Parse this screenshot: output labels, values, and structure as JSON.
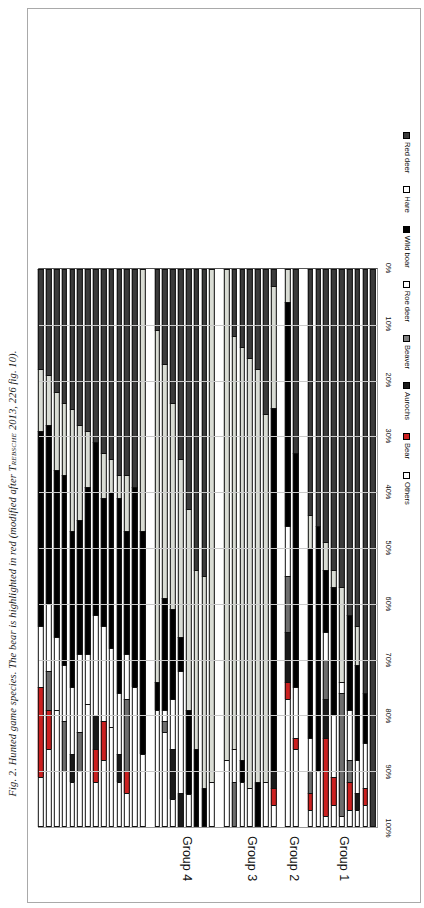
{
  "caption": {
    "prefix": "Fig. 2. Hunted game species. The bear is highlighted in red (modified after ",
    "author": "Trebsche",
    "suffix": " 2013, 226 fig. 10)."
  },
  "chart_data": {
    "type": "bar",
    "orientation": "horizontal",
    "stacked": true,
    "title": "Hunted game species",
    "xlabel": "",
    "ylabel": "",
    "xlim": [
      0,
      100
    ],
    "grid": true,
    "legend_position": "top",
    "axis_ticks": [
      "0%",
      "10%",
      "20%",
      "30%",
      "40%",
      "50%",
      "60%",
      "70%",
      "80%",
      "90%",
      "100%"
    ],
    "legend": [
      {
        "name": "Red deer",
        "color": "#3b3b3b",
        "border": "#000000"
      },
      {
        "name": "Hare",
        "color": "#ffffff",
        "border": "#000000"
      },
      {
        "name": "Wild boar",
        "color": "#000000",
        "border": "#000000"
      },
      {
        "name": "Roe deer",
        "color": "#ffffff",
        "border": "#000000"
      },
      {
        "name": "Beaver",
        "color": "#808080",
        "border": "#000000"
      },
      {
        "name": "Aurochs",
        "color": "#1a1a1a",
        "border": "#000000"
      },
      {
        "name": "Bear",
        "color": "#cc2020",
        "border": "#000000"
      },
      {
        "name": "Others",
        "color": "#ffffff",
        "border": "#000000"
      }
    ],
    "series_order": [
      "Red deer",
      "Roe deer",
      "Wild boar",
      "Hare",
      "Beaver",
      "Aurochs",
      "Bear",
      "Others"
    ],
    "series_colors": {
      "Red deer": "#3b3b3b",
      "Roe deer": "#d9dcd4",
      "Wild boar": "#000000",
      "Hare": "#ffffff",
      "Beaver": "#6e6e6e",
      "Aurochs": "#1a1a1a",
      "Bear": "#cc2020",
      "Others": "#ffffff"
    },
    "groups": [
      {
        "label": "Group 1",
        "count": 9
      },
      {
        "label": "Group 2",
        "count": 2
      },
      {
        "label": "Group 3",
        "count": 7
      },
      {
        "label": "Group 4",
        "count": 8
      },
      {
        "label": "Group 5",
        "count": 16
      }
    ],
    "categories": [
      "Tartscher Bichl",
      "Perchtoldsdorf-Bachacker",
      "Inzersdorf-Walpersdorf Nord",
      "Frauenberg bei Weitenburg",
      "Châtillon-sur-Glâne",
      "Burgstallkogel",
      "Eiersberg",
      "Most na Soči",
      "Heuneburg VIb-I",
      "Arnsleiden",
      "Breisach-Münsterberg",
      "Geispolsheim",
      "Wolfgantzen",
      "Tešetice",
      "Göllersreuther Platte",
      "Jenštejn",
      "Bretten-Bauerbach",
      "Unterparschenbrunn",
      "Poštelovice",
      "Radovesice (I-III)",
      "Göttlesbrunn",
      "Stuttgart-Mühlhausen",
      "Hochdorf",
      "Heilbronn-Neckargartach",
      "Tuchoměřice",
      "Heidengraben",
      "Niedererlbach",
      "Vadena/Pfatten I-III",
      "Oberschauersberg",
      "Kamegg",
      "Nördlingen-Baldingen",
      "Dürrnberg-Ramsautal",
      "Stična I-III",
      "Stufels-Dominik I-VIII",
      "Staffelberg",
      "Rottenburg-Siebenlinden",
      "Praha-Podboří",
      "Michelstetten",
      "Ehrenbürg",
      "Bad Friedrichshall-Maßleiten"
    ],
    "rows": [
      {
        "category": "Tartscher Bichl",
        "values": {
          "Red deer": 100,
          "Roe deer": 0,
          "Wild boar": 0,
          "Hare": 0,
          "Beaver": 0,
          "Aurochs": 0,
          "Bear": 0,
          "Others": 0
        }
      },
      {
        "category": "Perchtoldsdorf-Bachacker",
        "values": {
          "Red deer": 76,
          "Roe deer": 0,
          "Wild boar": 9,
          "Hare": 8,
          "Beaver": 0,
          "Aurochs": 0,
          "Bear": 3,
          "Others": 4
        }
      },
      {
        "category": "Inzersdorf-Walpersdorf Nord",
        "values": {
          "Red deer": 64,
          "Roe deer": 7,
          "Wild boar": 17,
          "Hare": 6,
          "Beaver": 0,
          "Aurochs": 3,
          "Bear": 0,
          "Others": 3
        }
      },
      {
        "category": "Frauenberg bei Weitenburg",
        "values": {
          "Red deer": 62,
          "Roe deer": 0,
          "Wild boar": 17,
          "Hare": 9,
          "Beaver": 4,
          "Aurochs": 0,
          "Bear": 5,
          "Others": 3
        }
      },
      {
        "category": "Châtillon-sur-Glâne",
        "values": {
          "Red deer": 57,
          "Roe deer": 17,
          "Wild boar": 0,
          "Hare": 2,
          "Beaver": 22,
          "Aurochs": 0,
          "Bear": 0,
          "Others": 2
        }
      },
      {
        "category": "Burgstallkogel",
        "values": {
          "Red deer": 54,
          "Roe deer": 3,
          "Wild boar": 23,
          "Hare": 11,
          "Beaver": 0,
          "Aurochs": 0,
          "Bear": 5,
          "Others": 4
        }
      },
      {
        "category": "Eiersberg",
        "values": {
          "Red deer": 49,
          "Roe deer": 5,
          "Wild boar": 11,
          "Hare": 5,
          "Beaver": 7,
          "Aurochs": 7,
          "Bear": 14,
          "Others": 2
        }
      },
      {
        "category": "Most na Soči",
        "values": {
          "Red deer": 46,
          "Roe deer": 0,
          "Wild boar": 44,
          "Hare": 10,
          "Beaver": 0,
          "Aurochs": 0,
          "Bear": 0,
          "Others": 0
        }
      },
      {
        "category": "Heuneburg VIb-I",
        "values": {
          "Red deer": 44,
          "Roe deer": 6,
          "Wild boar": 34,
          "Hare": 6,
          "Beaver": 4,
          "Aurochs": 0,
          "Bear": 3,
          "Others": 3
        }
      },
      {
        "category": "Arnsleiden",
        "values": {
          "Red deer": 33,
          "Roe deer": 0,
          "Wild boar": 42,
          "Hare": 9,
          "Beaver": 0,
          "Aurochs": 0,
          "Bear": 2,
          "Others": 14
        }
      },
      {
        "category": "Breisach-Münsterberg",
        "values": {
          "Red deer": 0,
          "Roe deer": 6,
          "Wild boar": 40,
          "Hare": 9,
          "Beaver": 10,
          "Aurochs": 9,
          "Bear": 3,
          "Others": 23
        }
      },
      {
        "category": "Geispolsheim",
        "values": {
          "Red deer": 3,
          "Roe deer": 22,
          "Wild boar": 65,
          "Hare": 0,
          "Beaver": 0,
          "Aurochs": 3,
          "Bear": 3,
          "Others": 4
        }
      },
      {
        "category": "Wolfgantzen",
        "values": {
          "Red deer": 26,
          "Roe deer": 66,
          "Wild boar": 0,
          "Hare": 8,
          "Beaver": 0,
          "Aurochs": 0,
          "Bear": 0,
          "Others": 0
        }
      },
      {
        "category": "Tešetice",
        "values": {
          "Red deer": 18,
          "Roe deer": 74,
          "Wild boar": 8,
          "Hare": 0,
          "Beaver": 0,
          "Aurochs": 0,
          "Bear": 0,
          "Others": 0
        }
      },
      {
        "category": "Göllersreuther Platte",
        "values": {
          "Red deer": 16,
          "Roe deer": 77,
          "Wild boar": 0,
          "Hare": 7,
          "Beaver": 0,
          "Aurochs": 0,
          "Bear": 0,
          "Others": 0
        }
      },
      {
        "category": "Jenštejn",
        "values": {
          "Red deer": 14,
          "Roe deer": 74,
          "Wild boar": 4,
          "Hare": 8,
          "Beaver": 0,
          "Aurochs": 0,
          "Bear": 0,
          "Others": 0
        }
      },
      {
        "category": "Bretten-Bauerbach",
        "values": {
          "Red deer": 12,
          "Roe deer": 74,
          "Wild boar": 0,
          "Hare": 6,
          "Beaver": 8,
          "Aurochs": 0,
          "Bear": 0,
          "Others": 0
        }
      },
      {
        "category": "Unterparschenbrunn",
        "values": {
          "Red deer": 0,
          "Roe deer": 88,
          "Wild boar": 0,
          "Hare": 12,
          "Beaver": 0,
          "Aurochs": 0,
          "Bear": 0,
          "Others": 0
        }
      },
      {
        "category": "Poštelovice",
        "values": {
          "Red deer": 0,
          "Roe deer": 92,
          "Wild boar": 0,
          "Hare": 8,
          "Beaver": 0,
          "Aurochs": 0,
          "Bear": 0,
          "Others": 0
        }
      },
      {
        "category": "Radovesice (I-III)",
        "values": {
          "Red deer": 55,
          "Roe deer": 38,
          "Wild boar": 7,
          "Hare": 0,
          "Beaver": 0,
          "Aurochs": 0,
          "Bear": 0,
          "Others": 0
        }
      },
      {
        "category": "Göttlesbrunn",
        "values": {
          "Red deer": 54,
          "Roe deer": 32,
          "Wild boar": 14,
          "Hare": 0,
          "Beaver": 0,
          "Aurochs": 0,
          "Bear": 0,
          "Others": 0
        }
      },
      {
        "category": "Stuttgart-Mühlhausen",
        "values": {
          "Red deer": 43,
          "Roe deer": 36,
          "Wild boar": 15,
          "Hare": 6,
          "Beaver": 0,
          "Aurochs": 0,
          "Bear": 0,
          "Others": 0
        }
      },
      {
        "category": "Hochdorf",
        "values": {
          "Red deer": 34,
          "Roe deer": 32,
          "Wild boar": 6,
          "Hare": 22,
          "Beaver": 0,
          "Aurochs": 6,
          "Bear": 0,
          "Others": 0
        }
      },
      {
        "category": "Heilbronn-Neckargartach",
        "values": {
          "Red deer": 24,
          "Roe deer": 37,
          "Wild boar": 16,
          "Hare": 9,
          "Beaver": 0,
          "Aurochs": 9,
          "Bear": 0,
          "Others": 5
        }
      },
      {
        "category": "Tuchoměřice",
        "values": {
          "Red deer": 17,
          "Roe deer": 42,
          "Wild boar": 20,
          "Hare": 2,
          "Beaver": 2,
          "Aurochs": 0,
          "Bear": 0,
          "Others": 17
        }
      },
      {
        "category": "Heidengraben",
        "values": {
          "Red deer": 11,
          "Roe deer": 63,
          "Wild boar": 5,
          "Hare": 21,
          "Beaver": 0,
          "Aurochs": 0,
          "Bear": 0,
          "Others": 0
        }
      },
      {
        "category": "Niedererlbach",
        "values": {
          "Red deer": 0,
          "Roe deer": 47,
          "Wild boar": 40,
          "Hare": 13,
          "Beaver": 0,
          "Aurochs": 0,
          "Bear": 0,
          "Others": 0
        }
      },
      {
        "category": "Vadena/Pfatten I-III",
        "values": {
          "Red deer": 39,
          "Roe deer": 0,
          "Wild boar": 36,
          "Hare": 0,
          "Beaver": 0,
          "Aurochs": 0,
          "Bear": 0,
          "Others": 25
        }
      },
      {
        "category": "Oberschauersberg",
        "values": {
          "Red deer": 37,
          "Roe deer": 10,
          "Wild boar": 22,
          "Hare": 8,
          "Beaver": 13,
          "Aurochs": 0,
          "Bear": 4,
          "Others": 6
        }
      },
      {
        "category": "Kamegg",
        "values": {
          "Red deer": 37,
          "Roe deer": 4,
          "Wild boar": 35,
          "Hare": 11,
          "Beaver": 0,
          "Aurochs": 5,
          "Bear": 0,
          "Others": 8
        }
      },
      {
        "category": "Nördlingen-Baldingen",
        "values": {
          "Red deer": 34,
          "Roe deer": 6,
          "Wild boar": 28,
          "Hare": 14,
          "Beaver": 0,
          "Aurochs": 0,
          "Bear": 0,
          "Others": 18
        }
      },
      {
        "category": "Dürrnberg-Ramsautal",
        "values": {
          "Red deer": 33,
          "Roe deer": 8,
          "Wild boar": 23,
          "Hare": 17,
          "Beaver": 0,
          "Aurochs": 0,
          "Bear": 7,
          "Others": 12
        }
      },
      {
        "category": "Stična I-III",
        "values": {
          "Red deer": 31,
          "Roe deer": 0,
          "Wild boar": 31,
          "Hare": 18,
          "Beaver": 0,
          "Aurochs": 6,
          "Bear": 6,
          "Others": 8
        }
      },
      {
        "category": "Stufels-Dominik I-VIII",
        "values": {
          "Red deer": 29,
          "Roe deer": 10,
          "Wild boar": 30,
          "Hare": 9,
          "Beaver": 0,
          "Aurochs": 0,
          "Bear": 0,
          "Others": 22
        }
      },
      {
        "category": "Staffelberg",
        "values": {
          "Red deer": 28,
          "Roe deer": 17,
          "Wild boar": 24,
          "Hare": 14,
          "Beaver": 7,
          "Aurochs": 0,
          "Bear": 0,
          "Others": 10
        }
      },
      {
        "category": "Rottenburg-Siebenlinden",
        "values": {
          "Red deer": 25,
          "Roe deer": 22,
          "Wild boar": 28,
          "Hare": 12,
          "Beaver": 0,
          "Aurochs": 5,
          "Bear": 0,
          "Others": 8
        }
      },
      {
        "category": "Praha-Podboří",
        "values": {
          "Red deer": 24,
          "Roe deer": 13,
          "Wild boar": 34,
          "Hare": 10,
          "Beaver": 9,
          "Aurochs": 0,
          "Bear": 0,
          "Others": 10
        }
      },
      {
        "category": "Michelstetten",
        "values": {
          "Red deer": 22,
          "Roe deer": 14,
          "Wild boar": 30,
          "Hare": 13,
          "Beaver": 0,
          "Aurochs": 0,
          "Bear": 0,
          "Others": 21
        }
      },
      {
        "category": "Ehrenbürg",
        "values": {
          "Red deer": 19,
          "Roe deer": 9,
          "Wild boar": 32,
          "Hare": 12,
          "Beaver": 7,
          "Aurochs": 0,
          "Bear": 7,
          "Others": 14
        }
      },
      {
        "category": "Bad Friedrichshall-Maßleiten",
        "values": {
          "Red deer": 18,
          "Roe deer": 11,
          "Wild boar": 35,
          "Hare": 11,
          "Beaver": 0,
          "Aurochs": 0,
          "Bear": 16,
          "Others": 9
        }
      }
    ]
  }
}
